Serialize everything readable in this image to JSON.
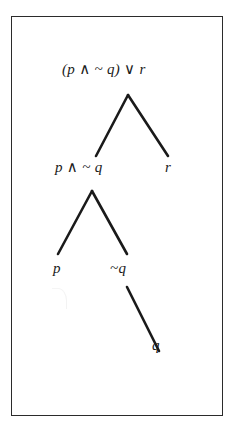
{
  "figure": {
    "kind": "parse-tree",
    "frame": {
      "border_color": "#2b2b2b",
      "background": "#ffffff"
    },
    "edge_color": "#1a1a1a",
    "text_color": "#1a1a1a",
    "nodes": {
      "root": "(p ∧ ~ q) ∨ r",
      "left_child": "p ∧ ~ q",
      "right_child": "r",
      "left_left_child": "p",
      "left_right_child": "~q",
      "leaf": "q"
    },
    "edges": [
      {
        "from": "root",
        "to": "left_child",
        "x1": 128,
        "y1": 95,
        "x2": 96,
        "y2": 156
      },
      {
        "from": "root",
        "to": "right_child",
        "x1": 128,
        "y1": 95,
        "x2": 168,
        "y2": 156
      },
      {
        "from": "left_child",
        "to": "left_left_child",
        "x1": 92,
        "y1": 191,
        "x2": 58,
        "y2": 254
      },
      {
        "from": "left_child",
        "to": "left_right_child",
        "x1": 92,
        "y1": 191,
        "x2": 127,
        "y2": 254
      },
      {
        "from": "left_right_child",
        "to": "leaf",
        "x1": 127,
        "y1": 287,
        "x2": 159,
        "y2": 351
      }
    ]
  }
}
